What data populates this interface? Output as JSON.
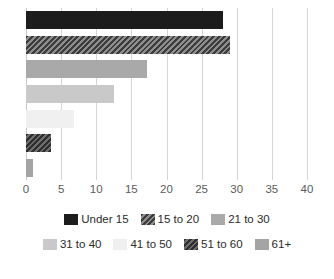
{
  "chart_data": {
    "type": "bar",
    "orientation": "horizontal",
    "title": "",
    "subtitle": "",
    "xlabel": "",
    "ylabel": "",
    "xlim": [
      0,
      40
    ],
    "xticks": [
      0,
      5,
      10,
      15,
      20,
      25,
      30,
      35,
      40
    ],
    "xtick_labels": [
      "0",
      "5",
      "10",
      "15",
      "20",
      "25",
      "30",
      "35",
      "40"
    ],
    "grid": true,
    "grid_axis": "x",
    "legend_position": "bottom",
    "categories": [
      "Under 15",
      "15 to 20",
      "21 to 30",
      "31 to 40",
      "41 to 50",
      "51 to 60",
      "61+"
    ],
    "values": [
      28,
      29,
      17.2,
      12.5,
      6.8,
      3.5,
      1
    ],
    "series": [
      {
        "name": "Age group share",
        "values": [
          28,
          29,
          17.2,
          12.5,
          6.8,
          3.5,
          1
        ]
      }
    ],
    "bars": [
      {
        "label": "Under 15",
        "value": 28,
        "fill_class": "fill-solid-near-black",
        "pattern": "solid",
        "color": "#1c1c1c"
      },
      {
        "label": "15 to 20",
        "value": 29,
        "fill_class": "fill-diag-dark",
        "pattern": "diagonal",
        "color": "#595959"
      },
      {
        "label": "21 to 30",
        "value": 17.2,
        "fill_class": "fill-solid-mid-gray",
        "pattern": "solid",
        "color": "#a9a9a9"
      },
      {
        "label": "31 to 40",
        "value": 12.5,
        "fill_class": "fill-solid-light-gray",
        "pattern": "solid",
        "color": "#c9c9c9"
      },
      {
        "label": "41 to 50",
        "value": 6.8,
        "fill_class": "fill-solid-pale",
        "pattern": "solid",
        "color": "#f0f0f0"
      },
      {
        "label": "51 to 60",
        "value": 3.5,
        "fill_class": "fill-diag-darker",
        "pattern": "diagonal",
        "color": "#4a4a4a"
      },
      {
        "label": "61+",
        "value": 1,
        "fill_class": "fill-solid-mid-gray-2",
        "pattern": "solid",
        "color": "#a4a4a4"
      }
    ],
    "legend": {
      "rows": [
        [
          {
            "label": "Under 15",
            "fill_class": "fill-solid-near-black",
            "color": "#1c1c1c"
          },
          {
            "label": "15 to 20",
            "fill_class": "fill-diag-dark",
            "color": "#595959"
          },
          {
            "label": "21 to 30",
            "fill_class": "fill-solid-mid-gray",
            "color": "#a9a9a9"
          }
        ],
        [
          {
            "label": "31 to 40",
            "fill_class": "fill-solid-light-gray",
            "color": "#c9c9c9"
          },
          {
            "label": "41 to 50",
            "fill_class": "fill-solid-pale",
            "color": "#f0f0f0"
          },
          {
            "label": "51 to 60",
            "fill_class": "fill-diag-darker",
            "color": "#4a4a4a"
          },
          {
            "label": "61+",
            "fill_class": "fill-solid-mid-gray-2",
            "color": "#a4a4a4"
          }
        ]
      ]
    },
    "colors": {
      "gridline": "#d6d6d6",
      "tick_label": "#5b5b5b",
      "legend_label": "#2b2b2b",
      "background": "#ffffff"
    }
  }
}
